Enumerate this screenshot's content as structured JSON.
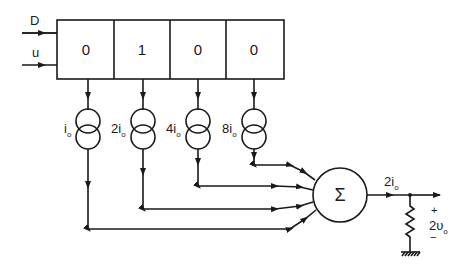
{
  "inputs": [
    {
      "label": "D"
    },
    {
      "label": "u"
    }
  ],
  "register": {
    "bits": [
      "0",
      "1",
      "0",
      "0"
    ]
  },
  "current_sources": [
    {
      "coef": "",
      "sym": "i",
      "sub": "o"
    },
    {
      "coef": "2",
      "sym": "i",
      "sub": "o"
    },
    {
      "coef": "4",
      "sym": "i",
      "sub": "o"
    },
    {
      "coef": "8",
      "sym": "i",
      "sub": "o"
    }
  ],
  "summer": {
    "symbol": "Σ"
  },
  "output": {
    "current": {
      "coef": "2",
      "sym": "i",
      "sub": "o"
    },
    "voltage": {
      "plus": "+",
      "minus": "−",
      "coef": "2",
      "sym": "υ",
      "sub": "o"
    }
  },
  "colors": {
    "ink": "#1a1a1a",
    "background": "#ffffff"
  }
}
